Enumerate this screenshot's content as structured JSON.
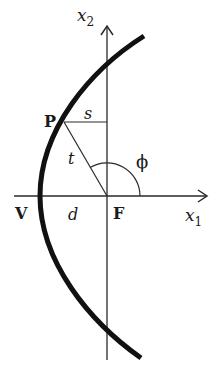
{
  "diagram": {
    "type": "parabola-focus-geometry",
    "axes": {
      "horizontal": {
        "label": "x",
        "subscript": "1"
      },
      "vertical": {
        "label": "x",
        "subscript": "2"
      }
    },
    "points": {
      "P": {
        "label": "P"
      },
      "V": {
        "label": "V"
      },
      "F": {
        "label": "F"
      }
    },
    "segments": {
      "s": {
        "label": "s"
      },
      "t": {
        "label": "t"
      },
      "d": {
        "label": "d"
      }
    },
    "angle": {
      "label": "ϕ"
    },
    "colors": {
      "curve": "#111111",
      "lines": "#2a2a2a",
      "text": "#1a1a1a",
      "background": "#ffffff"
    }
  }
}
